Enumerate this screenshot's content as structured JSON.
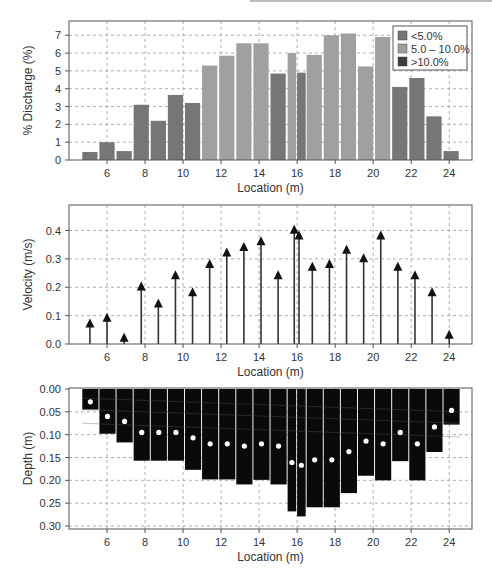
{
  "chart_data": [
    {
      "type": "bar",
      "title": "",
      "xlabel": "Location (m)",
      "ylabel": "% Discharge (%)",
      "xlim": [
        4.0,
        25.2
      ],
      "ylim": [
        0,
        7.8
      ],
      "xticks": [
        6,
        8,
        10,
        12,
        14,
        16,
        18,
        20,
        22,
        24
      ],
      "yticks": [
        0,
        1,
        2,
        3,
        4,
        5,
        6,
        7
      ],
      "grid": true,
      "legend_position": "upper right",
      "legend": [
        {
          "label": "<5.0%",
          "color": "#767676"
        },
        {
          "label": "5.0 – 10.0%",
          "color": "#a0a0a0"
        },
        {
          "label": ">10.0%",
          "color": "#3c3c3c"
        }
      ],
      "bars": [
        {
          "x0": 4.7,
          "x1": 5.5,
          "value": 0.45,
          "class": "<5.0%"
        },
        {
          "x0": 5.6,
          "x1": 6.4,
          "value": 1.0,
          "class": "<5.0%"
        },
        {
          "x0": 6.5,
          "x1": 7.3,
          "value": 0.5,
          "class": "<5.0%"
        },
        {
          "x0": 7.4,
          "x1": 8.2,
          "value": 3.1,
          "class": "<5.0%"
        },
        {
          "x0": 8.3,
          "x1": 9.1,
          "value": 2.2,
          "class": "<5.0%"
        },
        {
          "x0": 9.2,
          "x1": 10.0,
          "value": 3.65,
          "class": "<5.0%"
        },
        {
          "x0": 10.1,
          "x1": 10.9,
          "value": 3.2,
          "class": "<5.0%"
        },
        {
          "x0": 11.0,
          "x1": 11.8,
          "value": 5.3,
          "class": "5.0 – 10.0%"
        },
        {
          "x0": 11.9,
          "x1": 12.7,
          "value": 5.85,
          "class": "5.0 – 10.0%"
        },
        {
          "x0": 12.8,
          "x1": 13.6,
          "value": 6.55,
          "class": "5.0 – 10.0%"
        },
        {
          "x0": 13.7,
          "x1": 14.5,
          "value": 6.55,
          "class": "5.0 – 10.0%"
        },
        {
          "x0": 14.6,
          "x1": 15.4,
          "value": 4.85,
          "class": "<5.0%"
        },
        {
          "x0": 15.5,
          "x1": 15.95,
          "value": 6.0,
          "class": "5.0 – 10.0%"
        },
        {
          "x0": 16.0,
          "x1": 16.45,
          "value": 4.9,
          "class": "<5.0%"
        },
        {
          "x0": 16.5,
          "x1": 17.3,
          "value": 5.9,
          "class": "5.0 – 10.0%"
        },
        {
          "x0": 17.4,
          "x1": 18.2,
          "value": 7.0,
          "class": "5.0 – 10.0%"
        },
        {
          "x0": 18.3,
          "x1": 19.1,
          "value": 7.1,
          "class": "5.0 – 10.0%"
        },
        {
          "x0": 19.2,
          "x1": 20.0,
          "value": 5.25,
          "class": "5.0 – 10.0%"
        },
        {
          "x0": 20.1,
          "x1": 20.9,
          "value": 6.9,
          "class": "5.0 – 10.0%"
        },
        {
          "x0": 21.0,
          "x1": 21.8,
          "value": 4.1,
          "class": "<5.0%"
        },
        {
          "x0": 21.9,
          "x1": 22.7,
          "value": 4.6,
          "class": "<5.0%"
        },
        {
          "x0": 22.8,
          "x1": 23.6,
          "value": 2.45,
          "class": "<5.0%"
        },
        {
          "x0": 23.7,
          "x1": 24.5,
          "value": 0.5,
          "class": "<5.0%"
        }
      ]
    },
    {
      "type": "scatter",
      "subtype": "vector-arrows",
      "title": "",
      "xlabel": "Location (m)",
      "ylabel": "Velocity (m/s)",
      "xlim": [
        4.0,
        25.2
      ],
      "ylim": [
        0,
        0.49
      ],
      "xticks": [
        6,
        8,
        10,
        12,
        14,
        16,
        18,
        20,
        22,
        24
      ],
      "yticks": [
        0.0,
        0.1,
        0.2,
        0.3,
        0.4
      ],
      "ytick_labels": [
        "0.0",
        "0.1",
        "0.2",
        "0.3",
        "0.4"
      ],
      "grid": true,
      "x": [
        5.1,
        6.0,
        6.9,
        7.8,
        8.7,
        9.6,
        10.5,
        11.4,
        12.3,
        13.2,
        14.1,
        15.0,
        15.85,
        16.1,
        16.8,
        17.7,
        18.6,
        19.5,
        20.4,
        21.3,
        22.2,
        23.1,
        24.0
      ],
      "values": [
        0.09,
        0.11,
        0.04,
        0.22,
        0.16,
        0.26,
        0.2,
        0.3,
        0.34,
        0.36,
        0.38,
        0.26,
        0.42,
        0.4,
        0.29,
        0.3,
        0.35,
        0.32,
        0.4,
        0.29,
        0.26,
        0.2,
        0.05
      ]
    },
    {
      "type": "bar",
      "subtype": "inverted-depth-profile",
      "title": "",
      "xlabel": "Location (m)",
      "ylabel": "Depth (m)",
      "xlim": [
        4.0,
        25.2
      ],
      "ylim": [
        0.305,
        0.0
      ],
      "xticks": [
        6,
        8,
        10,
        12,
        14,
        16,
        18,
        20,
        22,
        24
      ],
      "yticks": [
        0.0,
        0.05,
        0.1,
        0.15,
        0.2,
        0.25,
        0.3
      ],
      "ytick_labels": [
        "0.00",
        "0.05",
        "0.10",
        "0.15",
        "0.20",
        "0.25",
        "0.30"
      ],
      "grid": true,
      "bars": [
        {
          "x0": 4.7,
          "x1": 5.55,
          "depth": 0.045,
          "dot": 0.028
        },
        {
          "x0": 5.6,
          "x1": 6.45,
          "depth": 0.098,
          "dot": 0.06
        },
        {
          "x0": 6.5,
          "x1": 7.35,
          "depth": 0.117,
          "dot": 0.071
        },
        {
          "x0": 7.4,
          "x1": 8.25,
          "depth": 0.157,
          "dot": 0.095
        },
        {
          "x0": 8.3,
          "x1": 9.15,
          "depth": 0.157,
          "dot": 0.095
        },
        {
          "x0": 9.2,
          "x1": 10.05,
          "depth": 0.157,
          "dot": 0.095
        },
        {
          "x0": 10.1,
          "x1": 10.95,
          "depth": 0.177,
          "dot": 0.107
        },
        {
          "x0": 11.0,
          "x1": 11.85,
          "depth": 0.198,
          "dot": 0.12
        },
        {
          "x0": 11.9,
          "x1": 12.75,
          "depth": 0.198,
          "dot": 0.12
        },
        {
          "x0": 12.8,
          "x1": 13.65,
          "depth": 0.209,
          "dot": 0.125
        },
        {
          "x0": 13.7,
          "x1": 14.55,
          "depth": 0.199,
          "dot": 0.12
        },
        {
          "x0": 14.6,
          "x1": 15.45,
          "depth": 0.209,
          "dot": 0.125
        },
        {
          "x0": 15.5,
          "x1": 15.95,
          "depth": 0.268,
          "dot": 0.161
        },
        {
          "x0": 16.0,
          "x1": 16.45,
          "depth": 0.279,
          "dot": 0.167
        },
        {
          "x0": 16.5,
          "x1": 17.35,
          "depth": 0.259,
          "dot": 0.155
        },
        {
          "x0": 17.4,
          "x1": 18.25,
          "depth": 0.259,
          "dot": 0.155
        },
        {
          "x0": 18.3,
          "x1": 19.15,
          "depth": 0.228,
          "dot": 0.137
        },
        {
          "x0": 19.2,
          "x1": 20.05,
          "depth": 0.19,
          "dot": 0.114
        },
        {
          "x0": 20.1,
          "x1": 20.95,
          "depth": 0.2,
          "dot": 0.12
        },
        {
          "x0": 21.0,
          "x1": 21.85,
          "depth": 0.158,
          "dot": 0.095
        },
        {
          "x0": 21.9,
          "x1": 22.75,
          "depth": 0.2,
          "dot": 0.12
        },
        {
          "x0": 22.8,
          "x1": 23.65,
          "depth": 0.138,
          "dot": 0.083
        },
        {
          "x0": 23.7,
          "x1": 24.55,
          "depth": 0.078,
          "dot": 0.047
        }
      ]
    }
  ],
  "colors": {
    "bar_low": "#767676",
    "bar_mid": "#a0a0a0",
    "bar_high": "#3c3c3c",
    "arrow": "#333333",
    "depth_fill": "#0a0a0a",
    "dot": "#ffffff",
    "grid": "#9a9a9a",
    "frame": "#555555"
  }
}
